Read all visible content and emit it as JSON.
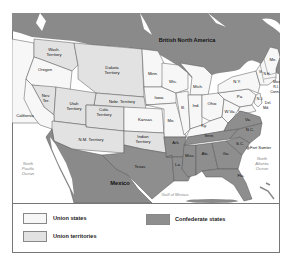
{
  "colors": {
    "union_states": "#f7f7f7",
    "union_territories": "#e2e2e2",
    "confederate_states": "#8e8e8e",
    "foreign": "#8a8a8a",
    "water": "#ffffff",
    "border": "#555555"
  },
  "map": {
    "regions": {
      "british_north_america": "British North America",
      "mexico": "Mexico"
    },
    "water_labels": {
      "north_pacific": [
        "North",
        "Pacific",
        "Ocean"
      ],
      "north_atlantic": [
        "North",
        "Atlantic",
        "Ocean"
      ],
      "gulf": "Gulf of Mexico"
    },
    "territories": {
      "wash": [
        "Wash.",
        "Territory"
      ],
      "dakota": [
        "Dakota",
        "Territory"
      ],
      "nebr": "Nebr. Territory",
      "nev": [
        "Nev.",
        "Ter."
      ],
      "utah": [
        "Utah",
        "Territory"
      ],
      "colo": [
        "Colo.",
        "Territory"
      ],
      "nm": "N.M. Territory",
      "indian": [
        "Indian",
        "Territory"
      ]
    },
    "union_states": {
      "oregon": "Oregon",
      "california": "California",
      "minn": "Minn.",
      "wis": "Wis.",
      "mich": "Mich.",
      "iowa": "Iowa",
      "kansas": "Kansas",
      "mo": "Mo.",
      "ill": "Ill.",
      "ind": "Ind.",
      "ohio": "Ohio",
      "ky": "Ky.",
      "wva": "W.Va.",
      "pa": "Pa.",
      "ny": "N.Y.",
      "vt": "Vt.",
      "nh": "N.H.",
      "me": "Me.",
      "mass": "Mass.",
      "ri": "R.I.",
      "conn": "Conn.",
      "nj": "N.J.",
      "del": "Del.",
      "md": "Md."
    },
    "confederate_states": {
      "texas": "Texas",
      "ark": "Ark.",
      "la": "La.",
      "miss": "Miss.",
      "ala": "Ala.",
      "ga": "Ga.",
      "fla": "Fla.",
      "tenn": "Tenn.",
      "sc": "S.C.",
      "nc": "N.C.",
      "va": "Va."
    },
    "landmarks": {
      "fort_sumter": "Fort Sumter"
    }
  },
  "legend": {
    "items": [
      {
        "label": "Union states",
        "color": "#f7f7f7"
      },
      {
        "label": "Union territories",
        "color": "#e2e2e2"
      },
      {
        "label": "Confederate states",
        "color": "#8e8e8e"
      }
    ]
  }
}
